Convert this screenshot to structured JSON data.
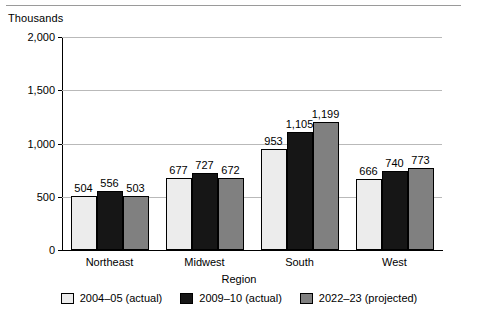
{
  "units_label": "Thousands",
  "axis_title_x": "Region",
  "legend": [
    {
      "label": "2004–05 (actual)",
      "color": "#ececec"
    },
    {
      "label": "2009–10 (actual)",
      "color": "#161616"
    },
    {
      "label": "2022–23 (projected)",
      "color": "#808080"
    }
  ],
  "y_ticks": [
    "0",
    "500",
    "1,000",
    "1,500",
    "2,000"
  ],
  "chart_data": {
    "type": "bar",
    "title": "",
    "subtitle": "",
    "xlabel": "Region",
    "ylabel": "Thousands",
    "ylim": [
      0,
      2000
    ],
    "yticks": [
      0,
      500,
      1000,
      1500,
      2000
    ],
    "grid": true,
    "legend_position": "bottom",
    "categories": [
      "Northeast",
      "Midwest",
      "South",
      "West"
    ],
    "series": [
      {
        "name": "2004–05 (actual)",
        "color": "#ececec",
        "values": [
          504,
          677,
          953,
          666
        ],
        "labels": [
          "504",
          "677",
          "953",
          "666"
        ]
      },
      {
        "name": "2009–10 (actual)",
        "color": "#161616",
        "values": [
          556,
          727,
          1105,
          740
        ],
        "labels": [
          "556",
          "727",
          "1,105",
          "740"
        ]
      },
      {
        "name": "2022–23 (projected)",
        "color": "#808080",
        "values": [
          503,
          672,
          1199,
          773
        ],
        "labels": [
          "503",
          "672",
          "1,199",
          "773"
        ]
      }
    ]
  }
}
